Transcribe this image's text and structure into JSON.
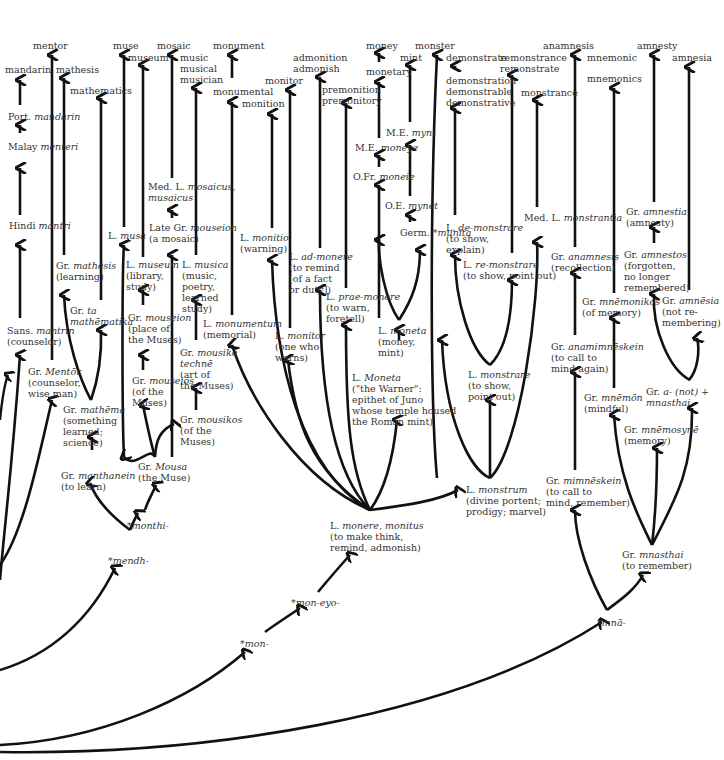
{
  "diagram": {
    "type": "etymology-tree",
    "roots": [
      "*men-",
      "*mendh-",
      "*monthi-",
      "*mon-",
      "*mon-eyo-",
      "*mnā-"
    ],
    "modern_words": [
      "mentor",
      "mandarin",
      "mathesis",
      "mathematics",
      "muse",
      "museum",
      "mosaic",
      "music",
      "musical",
      "musician",
      "monument",
      "monumental",
      "monition",
      "monitor",
      "admonition",
      "admonish",
      "premonition",
      "premonitory",
      "money",
      "monetary",
      "mint",
      "monster",
      "demonstrate",
      "demonstration",
      "demonstrable",
      "demonstrative",
      "remonstrance",
      "remonstrate",
      "monstrance",
      "anamnesis",
      "mnemonic",
      "mnemonics",
      "amnesty",
      "amnesia"
    ]
  },
  "nodes": {
    "mentor": {
      "text": "mentor",
      "x": 33,
      "y": 40
    },
    "mandarin": {
      "text": "mandarin",
      "x": 5,
      "y": 64
    },
    "mathesis": {
      "text": "mathesis",
      "x": 56,
      "y": 64
    },
    "mathematics": {
      "text": "mathematics",
      "x": 70,
      "y": 85
    },
    "muse": {
      "text": "muse",
      "x": 113,
      "y": 40
    },
    "museum": {
      "text": "museum",
      "x": 128,
      "y": 52
    },
    "mosaic": {
      "text": "mosaic",
      "x": 157,
      "y": 40
    },
    "music": {
      "text": "music\nmusical\nmusician",
      "x": 180,
      "y": 52
    },
    "monument": {
      "text": "monument",
      "x": 213,
      "y": 40
    },
    "monumental": {
      "text": "monumental",
      "x": 213,
      "y": 86
    },
    "monition": {
      "text": "monition",
      "x": 242,
      "y": 98
    },
    "monitor": {
      "text": "monitor",
      "x": 265,
      "y": 75
    },
    "admonition": {
      "text": "admonition\nadmonish",
      "x": 293,
      "y": 52
    },
    "premonition": {
      "text": "premonition\npremonitory",
      "x": 322,
      "y": 84
    },
    "money": {
      "text": "money",
      "x": 366,
      "y": 40
    },
    "monetary": {
      "text": "monetary",
      "x": 366,
      "y": 66
    },
    "mint": {
      "text": "mint",
      "x": 400,
      "y": 52
    },
    "monster": {
      "text": "monster",
      "x": 415,
      "y": 40
    },
    "demonstrate": {
      "text": "demonstrate",
      "x": 446,
      "y": 52
    },
    "demonstration": {
      "text": "demonstration\ndemonstrable\ndemonstrative",
      "x": 446,
      "y": 75
    },
    "remonstrance": {
      "text": "remonstrance\nremonstrate",
      "x": 500,
      "y": 52
    },
    "monstrance": {
      "text": "monstrance",
      "x": 521,
      "y": 87
    },
    "anamnesis": {
      "text": "anamnesis",
      "x": 543,
      "y": 40
    },
    "mnemonic": {
      "text": "mnemonic",
      "x": 587,
      "y": 52
    },
    "mnemonics": {
      "text": "mnemonics",
      "x": 587,
      "y": 73
    },
    "amnesty": {
      "text": "amnesty",
      "x": 637,
      "y": 40
    },
    "amnesia": {
      "text": "amnesia",
      "x": 672,
      "y": 52
    },
    "port_mandarin": {
      "lang": "Port.",
      "word": "mandarin",
      "gloss": "",
      "x": 8,
      "y": 111
    },
    "malay_menteri": {
      "lang": "Malay",
      "word": "menteri",
      "gloss": "",
      "x": 8,
      "y": 141
    },
    "hindi_mantri": {
      "lang": "Hindi",
      "word": "mantri",
      "gloss": "",
      "x": 9,
      "y": 220
    },
    "sans_mantrin": {
      "lang": "Sans.",
      "word": "mantrin",
      "gloss": "(counselor)",
      "x": 7,
      "y": 325
    },
    "gr_mentor": {
      "lang": "Gr.",
      "word": "Mentōr",
      "gloss": "(counselor,\nwise man)",
      "x": 28,
      "y": 366
    },
    "gr_mathesis": {
      "lang": "Gr.",
      "word": "mathēsis",
      "gloss": "(learning)",
      "x": 56,
      "y": 260
    },
    "gr_ta_mathematika": {
      "lang": "Gr.",
      "word": "ta\nmathēmatika",
      "gloss": "",
      "x": 70,
      "y": 305
    },
    "gr_mathema": {
      "lang": "Gr.",
      "word": "mathēma",
      "gloss": "(something\nlearned;\nscience)",
      "x": 63,
      "y": 404
    },
    "gr_manthanein": {
      "lang": "Gr.",
      "word": "manthanein",
      "gloss": "(to learn)",
      "x": 61,
      "y": 470
    },
    "l_musa": {
      "lang": "L.",
      "word": "musa",
      "gloss": "",
      "x": 108,
      "y": 230
    },
    "l_museum": {
      "lang": "L.",
      "word": "museum",
      "gloss": "(library,\nstudy)",
      "x": 126,
      "y": 259
    },
    "gr_mouseion_place": {
      "lang": "Gr.",
      "word": "mouseion",
      "gloss": "(place of\nthe Muses)",
      "x": 128,
      "y": 312
    },
    "gr_mouseios": {
      "lang": "Gr.",
      "word": "mouseios",
      "gloss": "(of the\nMuses)",
      "x": 132,
      "y": 375
    },
    "gr_mousa": {
      "lang": "Gr.",
      "word": "Mousa",
      "gloss": "(the Muse)",
      "x": 138,
      "y": 461
    },
    "med_l_mosaicus": {
      "lang": "Med. L.",
      "word": "mosaicus,\nmusaicus",
      "gloss": "",
      "x": 148,
      "y": 181
    },
    "late_gr_mouseion": {
      "lang": "Late Gr.",
      "word": "mouseion",
      "gloss": "(a mosaic)",
      "x": 149,
      "y": 222
    },
    "l_musica": {
      "lang": "L.",
      "word": "musica",
      "gloss": "(music,\npoetry,\nlearned\nstudy)",
      "x": 182,
      "y": 259
    },
    "gr_mousike_techne": {
      "lang": "Gr.",
      "word": "mousikē\ntechnē",
      "gloss": "(art of\nthe Muses)",
      "x": 180,
      "y": 347
    },
    "gr_mousikos": {
      "lang": "Gr.",
      "word": "mousikos",
      "gloss": "(of the\nMuses)",
      "x": 180,
      "y": 414
    },
    "l_monumentum": {
      "lang": "L.",
      "word": "monumentum",
      "gloss": "(memorial)",
      "x": 203,
      "y": 318
    },
    "l_monitio": {
      "lang": "L.",
      "word": "monitio",
      "gloss": "(warning)",
      "x": 240,
      "y": 232
    },
    "l_monitor": {
      "lang": "L.",
      "word": "monitor",
      "gloss": "(one who\nwarns)",
      "x": 275,
      "y": 330
    },
    "l_ad_monere": {
      "lang": "L.",
      "word": "ad-monere",
      "gloss": "(to remind\n[of a fact\nor duty])",
      "x": 289,
      "y": 251
    },
    "l_prae_monere": {
      "lang": "L.",
      "word": "prae-monere",
      "gloss": "(to warn,\nforetell)",
      "x": 326,
      "y": 291
    },
    "l_moneta_goddess": {
      "lang": "L.",
      "word": "Moneta",
      "gloss": "(\"the Warner\":\nepithet of Juno\nwhose temple housed\nthe Roman mint)",
      "x": 352,
      "y": 372
    },
    "l_moneta": {
      "lang": "L.",
      "word": "moneta",
      "gloss": "(money,\nmint)",
      "x": 378,
      "y": 325
    },
    "ofr_moneie": {
      "lang": "O.Fr.",
      "word": "moneie",
      "gloss": "",
      "x": 353,
      "y": 171
    },
    "me_moneye": {
      "lang": "M.E.",
      "word": "moneye",
      "gloss": "",
      "x": 355,
      "y": 142
    },
    "me_mynt": {
      "lang": "M.E.",
      "word": "mynt",
      "gloss": "",
      "x": 386,
      "y": 127
    },
    "oe_mynet": {
      "lang": "O.E.",
      "word": "mynet",
      "gloss": "",
      "x": 385,
      "y": 200
    },
    "germ_munita": {
      "lang": "Germ.",
      "word": "*munita",
      "gloss": "",
      "x": 400,
      "y": 227
    },
    "l_de_monstrare": {
      "lang": "L.",
      "word": "de-monstrare",
      "gloss": "(to show,\nexplain)",
      "x": 446,
      "y": 222
    },
    "l_re_monstrare": {
      "lang": "L.",
      "word": "re-monstrare",
      "gloss": "(to show, point out)",
      "x": 463,
      "y": 259
    },
    "l_monstrare": {
      "lang": "L.",
      "word": "monstrare",
      "gloss": "(to show,\npoint out)",
      "x": 468,
      "y": 369
    },
    "l_monstrum": {
      "lang": "L.",
      "word": "monstrum",
      "gloss": "(divine portent;\nprodigy; marvel)",
      "x": 466,
      "y": 484
    },
    "l_monere": {
      "lang": "L.",
      "word": "monere, monitus",
      "gloss": "(to make think,\nremind, admonish)",
      "x": 330,
      "y": 520
    },
    "med_l_monstrantia": {
      "lang": "Med. L.",
      "word": "monstrantia",
      "gloss": "",
      "x": 524,
      "y": 212
    },
    "gr_anamnesis": {
      "lang": "Gr.",
      "word": "anamnesis",
      "gloss": "(recollection)",
      "x": 551,
      "y": 251
    },
    "gr_anamimneskein": {
      "lang": "Gr.",
      "word": "anamimnēskein",
      "gloss": "(to call to\nmind again)",
      "x": 551,
      "y": 341
    },
    "gr_mimneskein": {
      "lang": "Gr.",
      "word": "mimnēskein",
      "gloss": "(to call to\nmind, remember)",
      "x": 546,
      "y": 475
    },
    "gr_mnemonikos": {
      "lang": "Gr.",
      "word": "mnēmonikos",
      "gloss": "(of memory)",
      "x": 582,
      "y": 296
    },
    "gr_mnemon": {
      "lang": "Gr.",
      "word": "mnēmōn",
      "gloss": "(mindful)",
      "x": 584,
      "y": 392
    },
    "gr_mnemosyne": {
      "lang": "Gr.",
      "word": "mnēmosynē",
      "gloss": "(memory)",
      "x": 624,
      "y": 424
    },
    "gr_mnasthai": {
      "lang": "Gr.",
      "word": "mnasthai",
      "gloss": "(to remember)",
      "x": 622,
      "y": 549
    },
    "gr_amnestia": {
      "lang": "Gr.",
      "word": "amnestia",
      "gloss": "(amnesty)",
      "x": 626,
      "y": 206
    },
    "gr_amnestos": {
      "lang": "Gr.",
      "word": "amnestos",
      "gloss": "(forgotten,\nno longer\nremembered)",
      "x": 624,
      "y": 249
    },
    "gr_amnesia": {
      "lang": "Gr.",
      "word": "amnēsia",
      "gloss": "(not re-\nmembering)",
      "x": 662,
      "y": 295
    },
    "gr_a_mnasthai": {
      "lang": "Gr.",
      "word": "a- (not) +\nmnasthai",
      "gloss": "",
      "x": 646,
      "y": 386
    },
    "root_mendh": {
      "text": "*mendh-",
      "x": 108,
      "y": 555
    },
    "root_monthi": {
      "text": "*monthi-",
      "x": 127,
      "y": 520
    },
    "root_mon": {
      "text": "*mon-",
      "x": 240,
      "y": 638
    },
    "root_mon_eyo": {
      "text": "*mon-eyo-",
      "x": 291,
      "y": 597
    },
    "root_mna": {
      "text": "*mnā-",
      "x": 597,
      "y": 617
    }
  }
}
